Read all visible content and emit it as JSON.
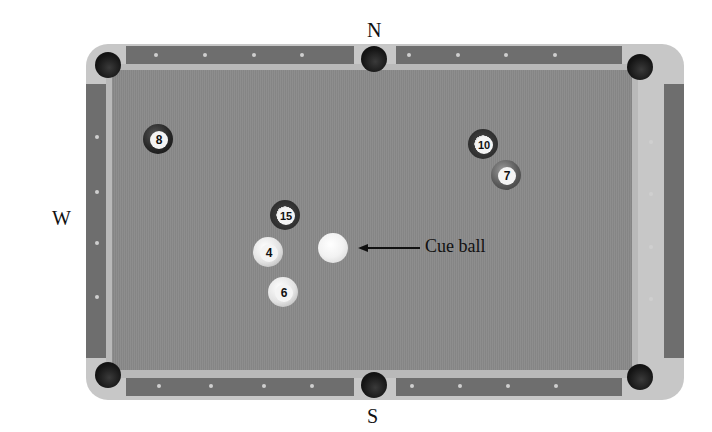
{
  "compass": {
    "north": "N",
    "south": "S",
    "east": "E",
    "west": "W"
  },
  "balls": [
    {
      "number": "8",
      "style": "solid-dark"
    },
    {
      "number": "10",
      "style": "stripe"
    },
    {
      "number": "7",
      "style": "solid-mid"
    },
    {
      "number": "15",
      "style": "stripe"
    },
    {
      "number": "4",
      "style": "light"
    },
    {
      "number": "6",
      "style": "light"
    }
  ],
  "cue_ball": {
    "label": "Cue ball"
  },
  "colors": {
    "felt": "#8a8a8a",
    "rail": "#6e6e6e",
    "cushion": "#b9b9b9",
    "pocket": "#111111"
  }
}
